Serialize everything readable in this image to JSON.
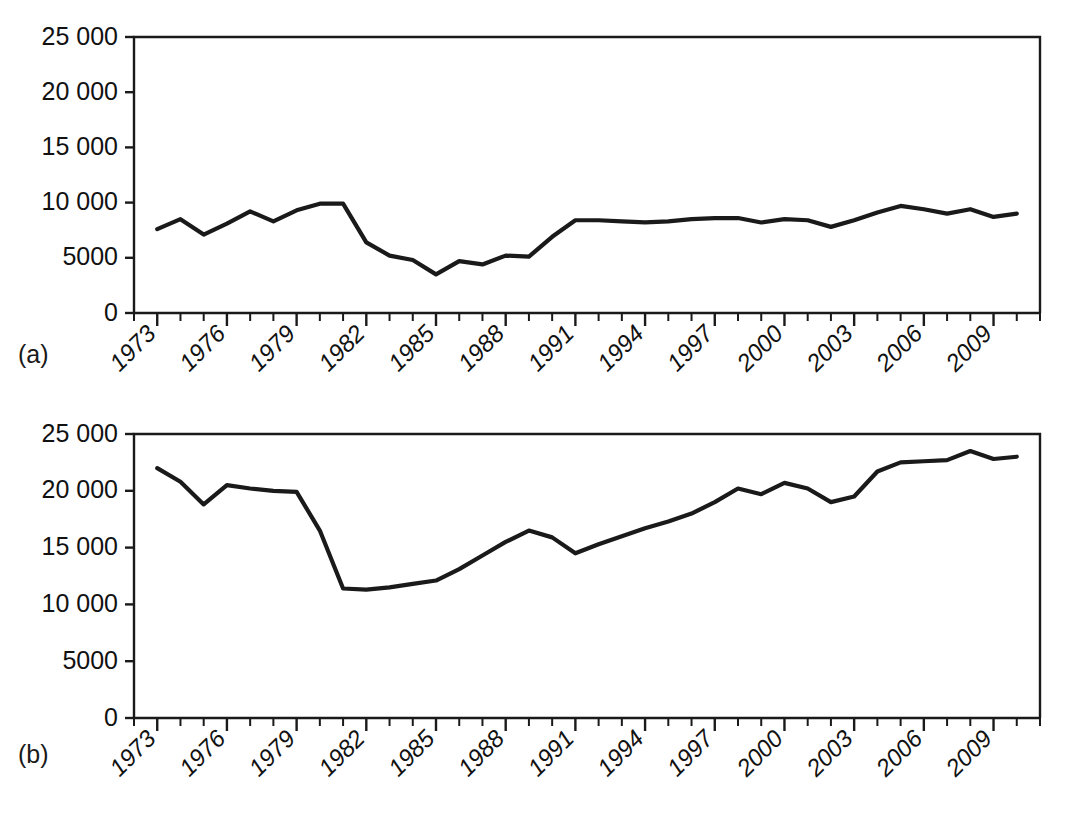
{
  "figure": {
    "background": "#ffffff",
    "line_color": "#1a1a1a",
    "axis_color": "#1a1a1a"
  },
  "panels": [
    {
      "id": "a",
      "label": "(a)"
    },
    {
      "id": "b",
      "label": "(b)"
    }
  ],
  "axis": {
    "y_tick_labels": [
      "25 000",
      "20 000",
      "15 000",
      "10 000",
      "5000",
      "0"
    ],
    "y_tick_values": [
      25000,
      20000,
      15000,
      10000,
      5000,
      0
    ],
    "x_tick_labels": [
      "1973",
      "1976",
      "1979",
      "1982",
      "1985",
      "1988",
      "1991",
      "1994",
      "1997",
      "2000",
      "2003",
      "2006",
      "2009"
    ],
    "x_tick_values": [
      1973,
      1976,
      1979,
      1982,
      1985,
      1988,
      1991,
      1994,
      1997,
      2000,
      2003,
      2006,
      2009
    ],
    "x_minor_step": 1,
    "x_min": 1972,
    "x_max": 2011
  },
  "chart_data": [
    {
      "type": "line",
      "id": "a",
      "title": "",
      "subtitle": "",
      "xlabel": "",
      "ylabel": "",
      "panel_label": "(a)",
      "grid": false,
      "legend": "none",
      "xlim": [
        1972,
        2011
      ],
      "ylim": [
        0,
        25000
      ],
      "yticks": [
        0,
        5000,
        10000,
        15000,
        20000,
        25000
      ],
      "ytick_labels": [
        "0",
        "5000",
        "10 000",
        "15 000",
        "20 000",
        "25 000"
      ],
      "xticks": [
        1973,
        1976,
        1979,
        1982,
        1985,
        1988,
        1991,
        1994,
        1997,
        2000,
        2003,
        2006,
        2009
      ],
      "x": [
        1973,
        1974,
        1975,
        1976,
        1977,
        1978,
        1979,
        1980,
        1981,
        1982,
        1983,
        1984,
        1985,
        1986,
        1987,
        1988,
        1989,
        1990,
        1991,
        1992,
        1993,
        1994,
        1995,
        1996,
        1997,
        1998,
        1999,
        2000,
        2001,
        2002,
        2003,
        2004,
        2005,
        2006,
        2007,
        2008,
        2009,
        2010
      ],
      "values": [
        7600,
        8500,
        7100,
        8100,
        9200,
        8300,
        9300,
        9900,
        9900,
        6400,
        5200,
        4800,
        3500,
        4700,
        4400,
        5200,
        5100,
        6900,
        8400,
        8400,
        8300,
        8200,
        8300,
        8500,
        8600,
        8600,
        8200,
        8500,
        8400,
        7800,
        8400,
        9100,
        9700,
        9400,
        9000,
        9400,
        8700,
        9000
      ]
    },
    {
      "type": "line",
      "id": "b",
      "title": "",
      "subtitle": "",
      "xlabel": "",
      "ylabel": "",
      "panel_label": "(b)",
      "grid": false,
      "legend": "none",
      "xlim": [
        1972,
        2011
      ],
      "ylim": [
        0,
        25000
      ],
      "yticks": [
        0,
        5000,
        10000,
        15000,
        20000,
        25000
      ],
      "ytick_labels": [
        "0",
        "5000",
        "10 000",
        "15 000",
        "20 000",
        "25 000"
      ],
      "xticks": [
        1973,
        1976,
        1979,
        1982,
        1985,
        1988,
        1991,
        1994,
        1997,
        2000,
        2003,
        2006,
        2009
      ],
      "x": [
        1973,
        1974,
        1975,
        1976,
        1977,
        1978,
        1979,
        1980,
        1981,
        1982,
        1983,
        1984,
        1985,
        1986,
        1987,
        1988,
        1989,
        1990,
        1991,
        1992,
        1993,
        1994,
        1995,
        1996,
        1997,
        1998,
        1999,
        2000,
        2001,
        2002,
        2003,
        2004,
        2005,
        2006,
        2007,
        2008,
        2009,
        2010
      ],
      "values": [
        22000,
        20800,
        18800,
        20500,
        20200,
        20000,
        19900,
        16500,
        11400,
        11300,
        11500,
        11800,
        12100,
        13100,
        14300,
        15500,
        16500,
        15900,
        14500,
        15300,
        16000,
        16700,
        17300,
        18000,
        19000,
        20200,
        19700,
        20700,
        20200,
        19000,
        19500,
        21700,
        22500,
        22600,
        22700,
        23500,
        22800,
        23000
      ]
    }
  ]
}
